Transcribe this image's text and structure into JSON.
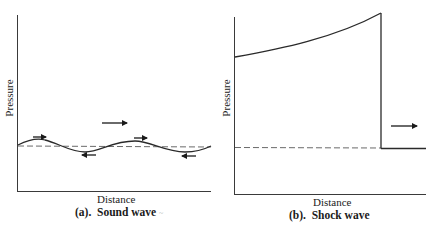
{
  "panels": [
    {
      "id": "a",
      "caption": "(a).  Sound wave",
      "caption_mark": "~",
      "xlabel": "Distance",
      "ylabel": "Pressure",
      "description": "Sinusoidal pressure oscillation around ambient pressure (dashed line); arrows show propagation direction and particle motion"
    },
    {
      "id": "b",
      "caption": "(b).  Shock wave",
      "xlabel": "Distance",
      "ylabel": "Pressure",
      "description": "Pressure rises gradually then drops abruptly at the shock front to ambient pressure (dashed line); arrow shows propagation direction"
    }
  ],
  "colors": {
    "line": "#2a2a2a",
    "dashed": "#6a6a6a",
    "axis": "#3a3a3a"
  },
  "icons": {
    "propagation": "right-arrow",
    "particle_forward": "right-arrow-small",
    "particle_backward": "left-arrow-small"
  }
}
